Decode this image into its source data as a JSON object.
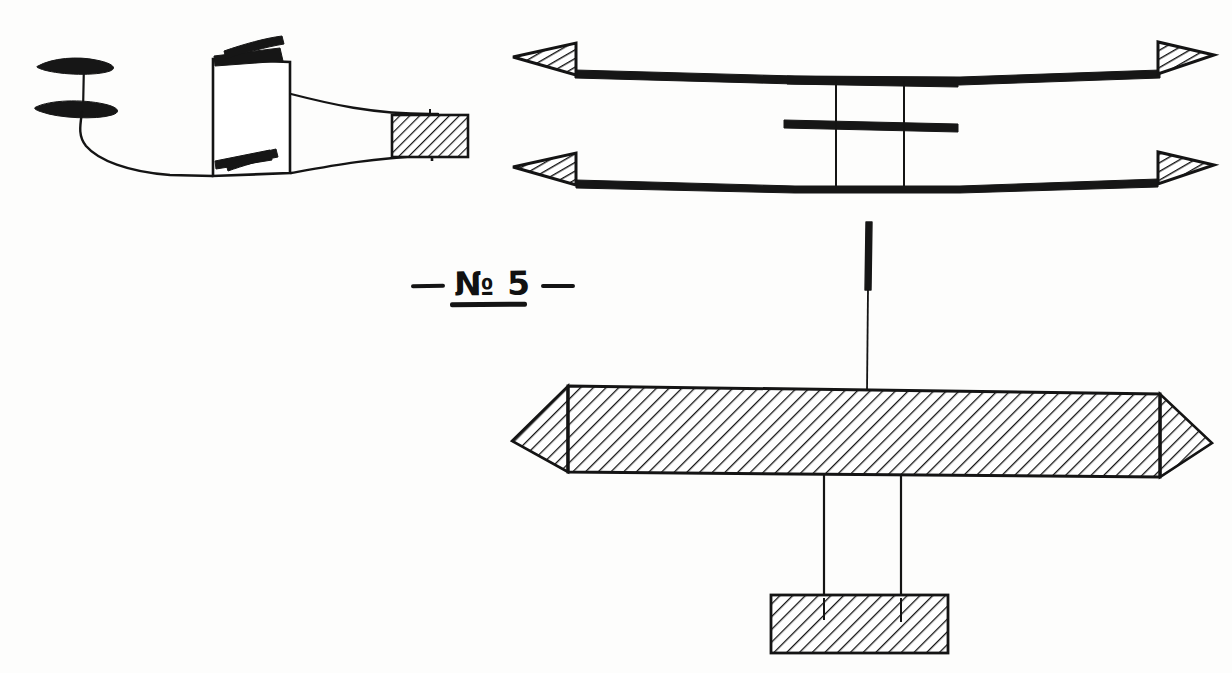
{
  "sheet": {
    "title": "Model aeroplane construction plate",
    "width": 1232,
    "height": 673,
    "background_color": "#fdfdfc",
    "ink_color": "#141414"
  },
  "plate_label": {
    "text": "№ 5",
    "numero_sign": "№",
    "plate_number": "5",
    "left_dash": "—",
    "right_dash": "—",
    "full_text": "— № 5 —",
    "underlined": true
  },
  "figures": [
    {
      "id": "side-view",
      "name": "fuselage-side-view",
      "description": "Side elevation of model aeroplane: two-blade propeller on shaft, rectangular fuselage box with diagonal braces, tapering tail boom ending in a hatched tail block.",
      "parts": [
        {
          "name": "propeller-blade-upper",
          "type": "blade",
          "hatched": false
        },
        {
          "name": "propeller-blade-lower",
          "type": "blade",
          "hatched": false
        },
        {
          "name": "propeller-shaft",
          "type": "line"
        },
        {
          "name": "nose-curve",
          "type": "curve"
        },
        {
          "name": "fuselage-box",
          "type": "rectangle",
          "hatched": false
        },
        {
          "name": "brace-upper",
          "type": "thick-bar"
        },
        {
          "name": "brace-lower",
          "type": "thick-bar"
        },
        {
          "name": "tail-boom-upper",
          "type": "curve"
        },
        {
          "name": "tail-boom-lower",
          "type": "curve"
        },
        {
          "name": "tail-block",
          "type": "rectangle",
          "hatched": true
        }
      ]
    },
    {
      "id": "wing-plan-view",
      "name": "biplane-wing-plan-view",
      "description": "Plan view of two long wing spars with hatched triangular wing tips at each end and a central cross-braced cabane structure.",
      "parts": [
        {
          "name": "upper-spar",
          "type": "thick-bar"
        },
        {
          "name": "lower-spar",
          "type": "thick-bar"
        },
        {
          "name": "wing-tip-upper-left",
          "type": "triangle",
          "hatched": true
        },
        {
          "name": "wing-tip-upper-right",
          "type": "triangle",
          "hatched": true
        },
        {
          "name": "wing-tip-lower-left",
          "type": "triangle",
          "hatched": true
        },
        {
          "name": "wing-tip-lower-right",
          "type": "triangle",
          "hatched": true
        },
        {
          "name": "cross-member-upper",
          "type": "thick-bar"
        },
        {
          "name": "cross-member-lower",
          "type": "thick-bar"
        },
        {
          "name": "strut-left",
          "type": "line"
        },
        {
          "name": "strut-right",
          "type": "line"
        }
      ]
    },
    {
      "id": "beam-assembly",
      "name": "main-beam-assembly",
      "description": "Long hatched main beam with chamfered pointed ends, a vertical mast rising from its centre and two struts descending to a hatched base block.",
      "parts": [
        {
          "name": "mast-stub",
          "type": "thick-bar"
        },
        {
          "name": "mast-line",
          "type": "line"
        },
        {
          "name": "main-beam",
          "type": "beam",
          "hatched": true
        },
        {
          "name": "beam-end-left",
          "type": "chamfer",
          "hatched": true
        },
        {
          "name": "beam-end-right",
          "type": "chamfer",
          "hatched": true
        },
        {
          "name": "drop-strut-left",
          "type": "line"
        },
        {
          "name": "drop-strut-right",
          "type": "line"
        },
        {
          "name": "base-block",
          "type": "rectangle",
          "hatched": true
        }
      ]
    }
  ]
}
